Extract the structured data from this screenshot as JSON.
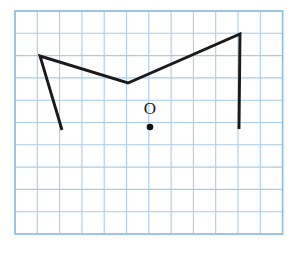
{
  "figure": {
    "background_color": "#ffffff",
    "width": 301,
    "height": 256
  },
  "grid": {
    "name": "graph-paper-grid",
    "line_color": "#a9cde9",
    "border_color": "#8fbfe0",
    "line_width": 1.1,
    "border_width": 1.6,
    "origin_x": 15,
    "origin_y": 11,
    "cell_size": 22.3,
    "columns": 12,
    "rows": 10
  },
  "polyline": {
    "name": "zigzag-polyline",
    "stroke_color": "#1a1a1a",
    "stroke_width": 2.9,
    "points": "62,130 40,56 128,83 240,34 239,129",
    "vertices": [
      {
        "label": "bottom-left-endpoint",
        "x": 62,
        "y": 130
      },
      {
        "label": "left-apex",
        "x": 40,
        "y": 56
      },
      {
        "label": "valley-vertex",
        "x": 128,
        "y": 83
      },
      {
        "label": "right-apex",
        "x": 240,
        "y": 34
      },
      {
        "label": "bottom-right-endpoint",
        "x": 239,
        "y": 129
      }
    ]
  },
  "point_marker": {
    "name": "point-o",
    "label": "O",
    "label_x": 150,
    "label_y": 110,
    "label_font_size": 17,
    "label_color": "#1a1a1a",
    "dot_x": 150,
    "dot_y": 127,
    "dot_radius": 3.3,
    "dot_color": "#111111"
  }
}
